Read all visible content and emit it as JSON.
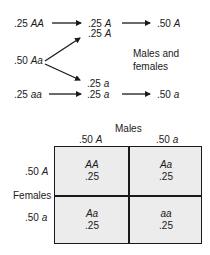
{
  "flow": {
    "sources": [
      {
        "freq": ".25",
        "genotype": "AA"
      },
      {
        "freq": ".50",
        "genotype": "Aa"
      },
      {
        "freq": ".25",
        "genotype": "aa"
      }
    ],
    "gametes_A": [
      {
        "freq": ".25",
        "allele": "A"
      },
      {
        "freq": ".25",
        "allele": "A"
      }
    ],
    "gametes_a": [
      {
        "freq": ".25",
        "allele": "a"
      },
      {
        "freq": ".25",
        "allele": "a"
      }
    ],
    "totals": [
      {
        "freq": ".50",
        "allele": "A"
      },
      {
        "freq": ".50",
        "allele": "a"
      }
    ],
    "note_line1": "Males and",
    "note_line2": "females"
  },
  "punnett": {
    "col_title": "Males",
    "row_title": "Females",
    "col_headers": [
      {
        "freq": ".50",
        "allele": "A"
      },
      {
        "freq": ".50",
        "allele": "a"
      }
    ],
    "row_headers": [
      {
        "freq": ".50",
        "allele": "A"
      },
      {
        "freq": ".50",
        "allele": "a"
      }
    ],
    "cells": [
      {
        "genotype": "AA",
        "freq": ".25"
      },
      {
        "genotype": "Aa",
        "freq": ".25"
      },
      {
        "genotype": "Aa",
        "freq": ".25"
      },
      {
        "genotype": "aa",
        "freq": ".25"
      }
    ],
    "fill_color": "#ececec",
    "line_color": "#1a1a1a"
  }
}
